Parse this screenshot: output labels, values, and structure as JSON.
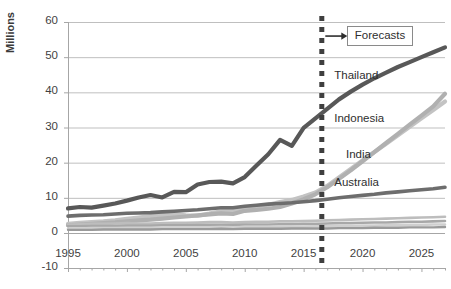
{
  "chart_data": {
    "type": "line",
    "title": "",
    "xlabel": "",
    "ylabel": "Millions",
    "xlim": [
      1995,
      2027
    ],
    "ylim": [
      -10,
      60
    ],
    "yticks": [
      -10,
      0,
      10,
      20,
      30,
      40,
      50,
      60
    ],
    "xticks": [
      1995,
      2000,
      2005,
      2010,
      2015,
      2020,
      2025
    ],
    "grid": "horizontal",
    "legend_position": "inline-right-labels",
    "annotations": [
      {
        "name": "forecast-divider",
        "type": "vertical-dashed-line",
        "x": 2016.5
      },
      {
        "name": "forecast-arrow",
        "type": "arrow",
        "from_x": 2016.5,
        "to_x": 2018.2,
        "y": 56,
        "direction": "right"
      },
      {
        "name": "forecasts-box",
        "type": "boxed-text",
        "text": "Forecasts",
        "x": 2019,
        "y": 56
      }
    ],
    "x": [
      1995,
      1996,
      1997,
      1998,
      1999,
      2000,
      2001,
      2002,
      2003,
      2004,
      2005,
      2006,
      2007,
      2008,
      2009,
      2010,
      2011,
      2012,
      2013,
      2014,
      2015,
      2016,
      2017,
      2018,
      2019,
      2020,
      2021,
      2022,
      2023,
      2024,
      2025,
      2026,
      2027
    ],
    "series": [
      {
        "name": "Thailand",
        "label": "Thailand",
        "color": "#585858",
        "width": 4.2,
        "label_x": 2017.6,
        "label_y": 44.5,
        "values": [
          7.0,
          7.4,
          7.2,
          7.8,
          8.4,
          9.2,
          10.1,
          10.8,
          10.1,
          11.7,
          11.6,
          13.8,
          14.5,
          14.6,
          14.1,
          15.9,
          19.2,
          22.4,
          26.5,
          24.8,
          29.9,
          32.6,
          35.3,
          38.0,
          40.2,
          42.2,
          44.0,
          45.6,
          47.2,
          48.6,
          50.0,
          51.4,
          52.8
        ]
      },
      {
        "name": "Indonesia",
        "label": "Indonesia",
        "color": "#c3c3c3",
        "width": 4.2,
        "label_x": 2017.6,
        "label_y": 32.0,
        "values": [
          2.6,
          2.9,
          3.1,
          3.3,
          3.6,
          4.0,
          4.4,
          4.8,
          5.1,
          5.3,
          5.0,
          4.9,
          5.5,
          6.2,
          6.3,
          7.0,
          7.6,
          8.0,
          8.8,
          9.4,
          10.4,
          11.5,
          13.4,
          15.8,
          18.2,
          20.6,
          23.0,
          25.4,
          27.8,
          30.2,
          32.6,
          35.0,
          37.4
        ]
      },
      {
        "name": "India",
        "label": "India",
        "color": "#b0b0b0",
        "width": 4.2,
        "label_x": 2018.6,
        "label_y": 22.0,
        "values": [
          2.2,
          2.4,
          2.6,
          2.8,
          3.0,
          3.3,
          3.6,
          3.8,
          4.1,
          4.4,
          4.7,
          5.0,
          5.3,
          5.6,
          5.4,
          6.3,
          6.6,
          6.9,
          7.4,
          8.4,
          9.6,
          11.0,
          13.0,
          15.4,
          17.8,
          20.4,
          23.0,
          25.6,
          28.2,
          30.8,
          33.4,
          36.0,
          39.6
        ]
      },
      {
        "name": "Australia",
        "label": "Australia",
        "color": "#6d6d6d",
        "width": 3.6,
        "label_x": 2017.6,
        "label_y": 13.8,
        "values": [
          4.8,
          5.0,
          5.1,
          5.2,
          5.4,
          5.6,
          5.7,
          5.8,
          6.0,
          6.2,
          6.4,
          6.6,
          6.9,
          7.2,
          7.2,
          7.6,
          7.9,
          8.2,
          8.4,
          8.6,
          8.9,
          9.2,
          9.6,
          10.0,
          10.4,
          10.7,
          11.0,
          11.4,
          11.7,
          12.0,
          12.3,
          12.6,
          13.0
        ]
      },
      {
        "name": "other-1",
        "label": "",
        "color": "#bdbdbd",
        "width": 2.6,
        "label_x": null,
        "label_y": null,
        "values": [
          2.4,
          2.5,
          2.6,
          2.6,
          2.7,
          2.8,
          2.7,
          2.7,
          2.8,
          2.9,
          2.9,
          3.0,
          3.1,
          3.1,
          3.0,
          3.1,
          3.2,
          3.2,
          3.3,
          3.3,
          3.4,
          3.5,
          3.6,
          3.7,
          3.8,
          3.9,
          4.0,
          4.1,
          4.2,
          4.3,
          4.4,
          4.5,
          4.6
        ]
      },
      {
        "name": "other-2",
        "label": "",
        "color": "#a8a8a8",
        "width": 2.6,
        "label_x": null,
        "label_y": null,
        "values": [
          1.9,
          1.9,
          2.0,
          2.0,
          2.0,
          2.1,
          2.1,
          2.1,
          2.2,
          2.2,
          2.2,
          2.3,
          2.3,
          2.3,
          2.3,
          2.4,
          2.4,
          2.4,
          2.5,
          2.5,
          2.6,
          2.6,
          2.7,
          2.8,
          2.8,
          2.9,
          3.0,
          3.0,
          3.1,
          3.2,
          3.2,
          3.3,
          3.4
        ]
      },
      {
        "name": "other-3",
        "label": "",
        "color": "#cfcfcf",
        "width": 2.6,
        "label_x": null,
        "label_y": null,
        "values": [
          1.3,
          1.3,
          1.4,
          1.4,
          1.4,
          1.5,
          1.5,
          1.5,
          1.5,
          1.6,
          1.6,
          1.6,
          1.6,
          1.7,
          1.6,
          1.7,
          1.7,
          1.7,
          1.8,
          1.8,
          1.8,
          1.9,
          1.9,
          2.0,
          2.0,
          2.1,
          2.1,
          2.2,
          2.2,
          2.3,
          2.3,
          2.4,
          2.4
        ]
      },
      {
        "name": "other-4",
        "label": "",
        "color": "#9a9a9a",
        "width": 2.4,
        "label_x": null,
        "label_y": null,
        "values": [
          0.9,
          0.9,
          0.9,
          1.0,
          1.0,
          1.0,
          1.0,
          1.0,
          1.1,
          1.1,
          1.1,
          1.1,
          1.1,
          1.2,
          1.1,
          1.2,
          1.2,
          1.2,
          1.2,
          1.3,
          1.3,
          1.3,
          1.3,
          1.4,
          1.4,
          1.4,
          1.5,
          1.5,
          1.5,
          1.6,
          1.6,
          1.6,
          1.7
        ]
      }
    ]
  },
  "style": {
    "axis_color": "#a6a6a6",
    "grid_color": "#bfbfbf",
    "tick_text_color": "#3f3f3f",
    "forecast_line_color": "#3f3f3f",
    "background": "#ffffff"
  },
  "labels": {
    "y_axis_title": "Millions",
    "forecasts": "Forecasts"
  }
}
